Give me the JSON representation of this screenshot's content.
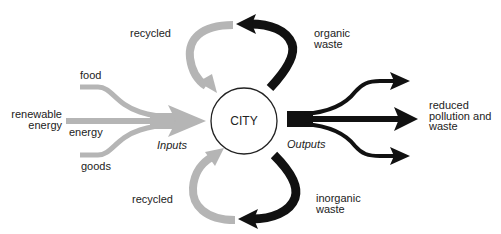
{
  "diagram": {
    "center_node": {
      "label": "CITY"
    },
    "section_labels": {
      "inputs": "Inputs",
      "outputs": "Outputs"
    },
    "inputs": [
      {
        "label": "food"
      },
      {
        "label": "energy"
      },
      {
        "label": "goods"
      }
    ],
    "source_label": {
      "line1": "renewable",
      "line2": "energy"
    },
    "recycled_top": {
      "label": "recycled"
    },
    "recycled_bottom": {
      "label": "recycled"
    },
    "organic_waste": {
      "line1": "organic",
      "line2": "waste"
    },
    "inorganic_waste": {
      "line1": "inorganic",
      "line2": "waste"
    },
    "output_result": {
      "line1": "reduced",
      "line2": "pollution and",
      "line3": "waste"
    },
    "colors": {
      "input_flow": "#b5b5b5",
      "output_flow": "#111111",
      "circle_stroke": "#222222",
      "text": "#222222"
    }
  }
}
